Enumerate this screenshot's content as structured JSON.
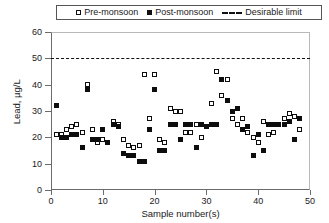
{
  "chart_data": {
    "type": "scatter",
    "title": "",
    "xlabel": "Sample number(s)",
    "ylabel": "Lead, µg/L",
    "xlim": [
      0,
      50
    ],
    "ylim": [
      0,
      60
    ],
    "xticks": [
      0,
      10,
      20,
      30,
      40,
      50
    ],
    "yticks": [
      0,
      10,
      20,
      30,
      40,
      50,
      60
    ],
    "grid": false,
    "legend_position": "top-center",
    "annotations": [
      {
        "label": "Desirable limit",
        "type": "hline",
        "value": 50,
        "style": "dashed"
      }
    ],
    "series": [
      {
        "name": "Pre-monsoon",
        "marker": "open-square",
        "color": "#ffffff",
        "edge_color": "#0d0d0d",
        "x": [
          1,
          2,
          3,
          4,
          5,
          6,
          7,
          8,
          9,
          10,
          11,
          12,
          13,
          14,
          15,
          16,
          17,
          18,
          19,
          20,
          21,
          22,
          23,
          24,
          25,
          26,
          27,
          28,
          29,
          30,
          31,
          32,
          33,
          34,
          35,
          36,
          37,
          38,
          39,
          40,
          41,
          42,
          43,
          44,
          45,
          46,
          47,
          48
        ],
        "y": [
          21,
          21,
          23,
          24,
          25,
          22,
          40,
          23,
          18,
          19,
          18,
          26,
          25,
          19,
          17,
          16,
          17,
          44,
          27,
          44,
          19,
          18,
          31,
          30,
          30,
          22,
          22,
          25,
          20,
          24,
          33,
          45,
          36,
          42,
          27,
          25,
          27,
          22,
          20,
          18,
          26,
          21,
          22,
          25,
          27,
          29,
          28,
          23
        ]
      },
      {
        "name": "Post-monsoon",
        "marker": "filled-square",
        "color": "#0d0d0d",
        "x": [
          1,
          2,
          3,
          4,
          5,
          6,
          7,
          8,
          9,
          10,
          11,
          12,
          13,
          14,
          15,
          16,
          17,
          18,
          19,
          20,
          21,
          22,
          23,
          24,
          25,
          26,
          27,
          28,
          29,
          30,
          31,
          32,
          33,
          34,
          35,
          36,
          37,
          38,
          39,
          40,
          41,
          42,
          43,
          44,
          45,
          46,
          47,
          48
        ],
        "y": [
          32,
          20,
          20,
          21,
          21,
          16,
          38,
          19,
          19,
          23,
          18,
          25,
          24,
          14,
          13,
          13,
          11,
          11,
          23,
          38,
          15,
          15,
          25,
          25,
          19,
          25,
          25,
          16,
          25,
          24,
          25,
          25,
          42,
          34,
          30,
          31,
          23,
          24,
          13,
          21,
          15,
          25,
          25,
          25,
          25,
          26,
          19,
          27
        ]
      }
    ]
  },
  "legend": {
    "entries": [
      {
        "label": "Pre-monsoon",
        "symbol": "open-square-icon"
      },
      {
        "label": "Post-monsoon",
        "symbol": "filled-square-icon"
      },
      {
        "label": "Desirable limit",
        "symbol": "dashed-line-icon"
      }
    ]
  },
  "axes": {
    "x_title": "Sample number(s)",
    "y_title": "Lead, µg/L",
    "x_tick_labels": [
      "0",
      "10",
      "20",
      "30",
      "40",
      "50"
    ],
    "y_tick_labels": [
      "0",
      "10",
      "20",
      "30",
      "40",
      "50",
      "60"
    ]
  },
  "colors": {
    "marker": "#0d0d0d",
    "axis": "#6b6b6b",
    "background": "#ffffff",
    "limit_line": "#111111"
  }
}
